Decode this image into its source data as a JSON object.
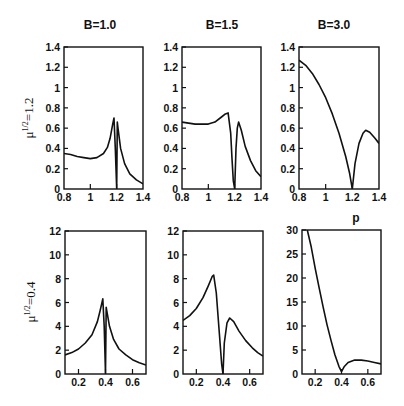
{
  "figure": {
    "column_titles": [
      "B=1.0",
      "B=1.5",
      "B=3.0"
    ],
    "row_labels": [
      "μ^{1/2}=1.2",
      "μ^{1/2}=0.4"
    ],
    "row_label_text": [
      "1.2",
      "0.4"
    ],
    "corner_label": "p"
  },
  "chart_data": [
    {
      "type": "line",
      "title": "B=1.0",
      "row": 0,
      "col": 0,
      "ylabel": "μ^{1/2}=1.2",
      "xlabel": "",
      "xlim": [
        0.8,
        1.4
      ],
      "ylim": [
        0,
        1.4
      ],
      "xticks": [
        0.8,
        1,
        1.2,
        1.4
      ],
      "xtick_labels": [
        "0.8",
        "1",
        "1.2",
        "1.4"
      ],
      "yticks": [
        0,
        0.2,
        0.4,
        0.6,
        0.8,
        1,
        1.2,
        1.4
      ],
      "ytick_labels": [
        "0",
        "0.2",
        "0.4",
        "0.6",
        "0.8",
        "1",
        "1.2",
        "1.4"
      ],
      "x": [
        0.8,
        0.85,
        0.9,
        0.95,
        1.0,
        1.05,
        1.1,
        1.13,
        1.15,
        1.17,
        1.18,
        1.19,
        1.2,
        1.2,
        1.205,
        1.21,
        1.23,
        1.26,
        1.3,
        1.35,
        1.4
      ],
      "y": [
        0.35,
        0.34,
        0.32,
        0.31,
        0.3,
        0.31,
        0.35,
        0.41,
        0.5,
        0.64,
        0.7,
        0.4,
        0.0,
        0.0,
        0.66,
        0.6,
        0.4,
        0.25,
        0.15,
        0.09,
        0.05
      ]
    },
    {
      "type": "line",
      "title": "B=1.5",
      "row": 0,
      "col": 1,
      "xlim": [
        0.8,
        1.4
      ],
      "ylim": [
        0,
        1.4
      ],
      "xticks": [
        0.8,
        1,
        1.2,
        1.4
      ],
      "xtick_labels": [
        "0.8",
        "1",
        "1.2",
        "1.4"
      ],
      "yticks": [
        0,
        0.2,
        0.4,
        0.6,
        0.8,
        1,
        1.2,
        1.4
      ],
      "ytick_labels": [
        "0",
        "0.2",
        "0.4",
        "0.6",
        "0.8",
        "1",
        "1.2",
        "1.4"
      ],
      "x": [
        0.8,
        0.85,
        0.9,
        0.95,
        1.0,
        1.05,
        1.1,
        1.13,
        1.15,
        1.17,
        1.18,
        1.19,
        1.2,
        1.21,
        1.22,
        1.23,
        1.25,
        1.28,
        1.32,
        1.36,
        1.4
      ],
      "y": [
        0.66,
        0.65,
        0.64,
        0.64,
        0.64,
        0.66,
        0.71,
        0.74,
        0.75,
        0.55,
        0.3,
        0.08,
        0.0,
        0.4,
        0.6,
        0.66,
        0.58,
        0.42,
        0.28,
        0.18,
        0.12
      ]
    },
    {
      "type": "line",
      "title": "B=3.0",
      "row": 0,
      "col": 2,
      "xlim": [
        0.8,
        1.4
      ],
      "ylim": [
        0,
        1.4
      ],
      "xticks": [
        0.8,
        1,
        1.2,
        1.4
      ],
      "xtick_labels": [
        "0.8",
        "1",
        "1.2",
        "1.4"
      ],
      "yticks": [
        0,
        0.2,
        0.4,
        0.6,
        0.8,
        1,
        1.2,
        1.4
      ],
      "ytick_labels": [
        "0",
        "0.2",
        "0.4",
        "0.6",
        "0.8",
        "1",
        "1.2",
        "1.4"
      ],
      "x": [
        0.8,
        0.85,
        0.9,
        0.95,
        1.0,
        1.05,
        1.1,
        1.15,
        1.18,
        1.2,
        1.22,
        1.25,
        1.28,
        1.3,
        1.33,
        1.37,
        1.4
      ],
      "y": [
        1.27,
        1.22,
        1.14,
        1.03,
        0.9,
        0.74,
        0.55,
        0.32,
        0.15,
        0.0,
        0.25,
        0.45,
        0.55,
        0.58,
        0.56,
        0.5,
        0.45
      ]
    },
    {
      "type": "line",
      "title": "",
      "row": 1,
      "col": 0,
      "ylabel": "μ^{1/2}=0.4",
      "xlim": [
        0.1,
        0.7
      ],
      "ylim": [
        0,
        12
      ],
      "xticks": [
        0.2,
        0.4,
        0.6
      ],
      "xtick_labels": [
        "0.2",
        "0.4",
        "0.6"
      ],
      "yticks": [
        0,
        2,
        4,
        6,
        8,
        10,
        12
      ],
      "ytick_labels": [
        "0",
        "2",
        "4",
        "6",
        "8",
        "10",
        "12"
      ],
      "x": [
        0.1,
        0.15,
        0.2,
        0.25,
        0.3,
        0.34,
        0.36,
        0.38,
        0.39,
        0.4,
        0.4,
        0.405,
        0.41,
        0.43,
        0.46,
        0.5,
        0.55,
        0.6,
        0.65,
        0.7
      ],
      "y": [
        1.6,
        1.8,
        2.1,
        2.6,
        3.3,
        4.4,
        5.3,
        6.3,
        4.0,
        0.0,
        0.0,
        5.6,
        5.3,
        4.0,
        2.9,
        2.1,
        1.6,
        1.2,
        0.95,
        0.75
      ]
    },
    {
      "type": "line",
      "title": "",
      "row": 1,
      "col": 1,
      "xlim": [
        0.1,
        0.7
      ],
      "ylim": [
        0,
        12
      ],
      "xticks": [
        0.2,
        0.4,
        0.6
      ],
      "xtick_labels": [
        "0.2",
        "0.4",
        "0.6"
      ],
      "yticks": [
        0,
        2,
        4,
        6,
        8,
        10,
        12
      ],
      "ytick_labels": [
        "0",
        "2",
        "4",
        "6",
        "8",
        "10",
        "12"
      ],
      "x": [
        0.1,
        0.15,
        0.2,
        0.25,
        0.29,
        0.32,
        0.33,
        0.35,
        0.37,
        0.39,
        0.4,
        0.41,
        0.43,
        0.45,
        0.48,
        0.52,
        0.57,
        0.62,
        0.66,
        0.7
      ],
      "y": [
        4.5,
        4.9,
        5.5,
        6.4,
        7.4,
        8.2,
        8.3,
        6.8,
        3.8,
        0.8,
        0.0,
        2.6,
        4.3,
        4.7,
        4.4,
        3.6,
        2.8,
        2.2,
        1.8,
        1.5
      ]
    },
    {
      "type": "line",
      "title": "",
      "row": 1,
      "col": 2,
      "annotation": "p",
      "xlim": [
        0.1,
        0.7
      ],
      "ylim": [
        0,
        30
      ],
      "xticks": [
        0.2,
        0.4,
        0.6
      ],
      "xtick_labels": [
        "0.2",
        "0.4",
        "0.6"
      ],
      "yticks": [
        0,
        5,
        10,
        15,
        20,
        25,
        30
      ],
      "ytick_labels": [
        "0",
        "5",
        "10",
        "15",
        "20",
        "25",
        "30"
      ],
      "x": [
        0.14,
        0.17,
        0.2,
        0.23,
        0.26,
        0.29,
        0.32,
        0.35,
        0.38,
        0.4,
        0.42,
        0.45,
        0.5,
        0.55,
        0.6,
        0.65,
        0.7
      ],
      "y": [
        30,
        26.5,
        22,
        18,
        14,
        10.3,
        7,
        4,
        1.6,
        0.5,
        1.5,
        2.4,
        2.9,
        2.9,
        2.7,
        2.4,
        2.1
      ]
    }
  ]
}
